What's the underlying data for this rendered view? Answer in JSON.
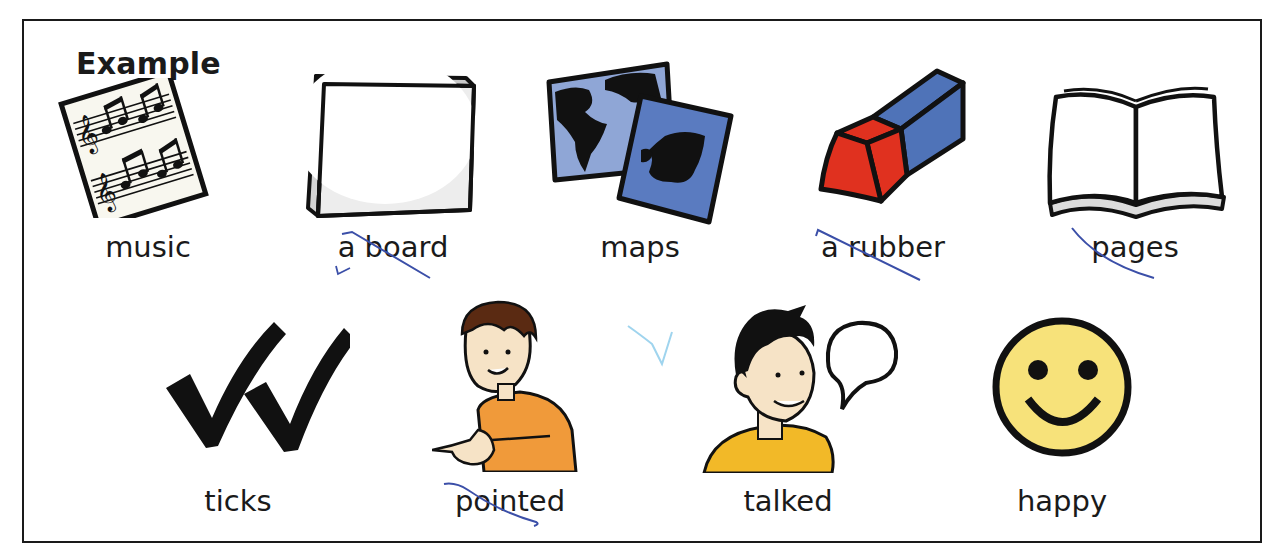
{
  "heading_partial": "g",
  "example_label": "Example",
  "items": [
    {
      "label": "music",
      "icon": "sheet-music-icon"
    },
    {
      "label": "a board",
      "icon": "whiteboard-icon"
    },
    {
      "label": "maps",
      "icon": "maps-icon"
    },
    {
      "label": "a rubber",
      "icon": "eraser-icon"
    },
    {
      "label": "pages",
      "icon": "open-book-icon"
    },
    {
      "label": "ticks",
      "icon": "double-tick-icon"
    },
    {
      "label": "pointed",
      "icon": "boy-pointing-icon"
    },
    {
      "label": "talked",
      "icon": "boy-talking-icon"
    },
    {
      "label": "happy",
      "icon": "smiley-face-icon"
    }
  ],
  "colors": {
    "map_light": "#8fa6d6",
    "map_dark": "#5a7bc0",
    "eraser_red": "#e0311f",
    "eraser_blue": "#4f73b8",
    "shirt_orange": "#f09a3a",
    "hoodie_yellow": "#f2b928",
    "smiley_yellow": "#f7e27a",
    "pen_blue": "#3b4fa8",
    "skin": "#f6e3c6",
    "hair_brown": "#5a2a12"
  }
}
